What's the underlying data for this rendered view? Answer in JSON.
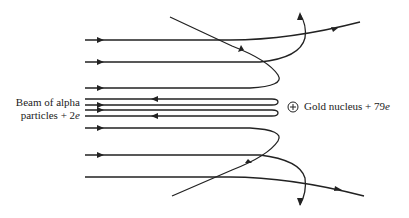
{
  "diagram": {
    "beam_label": {
      "line1": "Beam of alpha",
      "line2_text": "particles + 2",
      "line2_italic": "e"
    },
    "nucleus_label": {
      "text": "Gold nucleus + 79",
      "italic": "e"
    },
    "nucleus_symbol": "plus-in-circle",
    "stroke_color": "#222222",
    "background_color": "#ffffff",
    "trajectories": [
      {
        "id": "top-pass-through",
        "incoming_y": 40,
        "outcome": "slightly deflected upward"
      },
      {
        "id": "upper-deflect",
        "incoming_y": 62,
        "outcome": "deflected sharply upward"
      },
      {
        "id": "upper-backscatter",
        "incoming_y": 88,
        "outcome": "scattered back up-left"
      },
      {
        "id": "near-head-on-upper",
        "incoming_y": 105,
        "outcome": "reflected back along y=99"
      },
      {
        "id": "near-head-on-lower",
        "incoming_y": 110,
        "outcome": "reflected back along y=116"
      },
      {
        "id": "lower-backscatter",
        "incoming_y": 128,
        "outcome": "scattered back down-left"
      },
      {
        "id": "lower-deflect",
        "incoming_y": 155,
        "outcome": "deflected sharply downward"
      },
      {
        "id": "bottom-pass-through",
        "incoming_y": 177,
        "outcome": "slightly deflected downward"
      }
    ]
  }
}
